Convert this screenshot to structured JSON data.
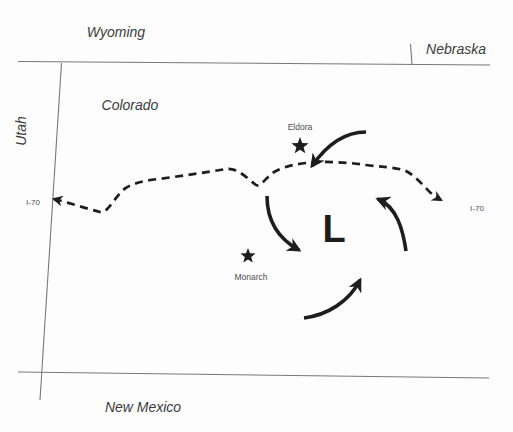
{
  "regions": {
    "wyoming": "Wyoming",
    "nebraska": "Nebraska",
    "utah": "Utah",
    "colorado": "Colorado",
    "new_mexico": "New Mexico"
  },
  "highway": {
    "left_label": "I-70",
    "right_label": "I-70"
  },
  "markers": [
    {
      "label": "Eldora"
    },
    {
      "label": "Monarch"
    }
  ],
  "low_pressure_symbol": "L",
  "colors": {
    "ink": "#1d1d1d",
    "border_line": "#787878",
    "state_label": "#3c3c3c",
    "small_label": "#4d4d4d",
    "background": "#fdfdfd"
  }
}
